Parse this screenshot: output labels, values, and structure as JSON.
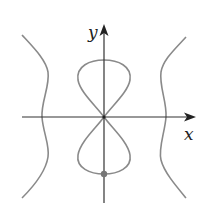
{
  "figure": {
    "x_axis_label": "x",
    "y_axis_label": "y",
    "colors": {
      "curve": "#8a8a8a",
      "axes": "#333333",
      "point": "#777777",
      "background": "#ffffff"
    },
    "marked_point": {
      "label": "",
      "position": "bottom of lower loop on y-axis"
    }
  }
}
